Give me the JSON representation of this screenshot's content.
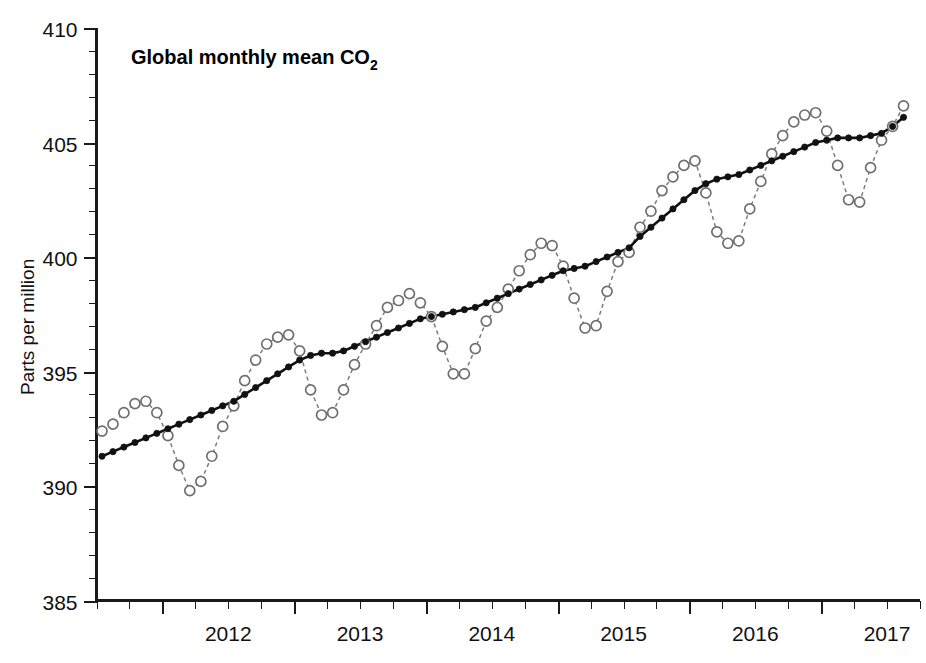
{
  "chart_data": {
    "type": "line",
    "title": "Global monthly mean CO2",
    "title_display": "Global monthly mean CO",
    "title_subscript": "2",
    "xlabel": "",
    "ylabel": "Parts per million",
    "ylim": [
      385,
      410
    ],
    "xlim": [
      2011.5,
      2017.75
    ],
    "grid": false,
    "legend": "none",
    "y_ticks_major": [
      385,
      390,
      395,
      400,
      405,
      410
    ],
    "y_ticks_major_labels": [
      "385",
      "390",
      "395",
      "400",
      "405",
      "410"
    ],
    "y_tick_minor_step": 1,
    "x_ticks_major": [
      2012,
      2013,
      2014,
      2015,
      2016,
      2017
    ],
    "x_ticks_major_labels": [
      "2012",
      "2013",
      "2014",
      "2015",
      "2016",
      "2017"
    ],
    "x_tick_minor_step": 0.25,
    "x_label_offset_years": 0.5,
    "series": [
      {
        "name": "Monthly mean",
        "style": "dashed-open-circles",
        "color": "#6f6f6f",
        "x": [
          2011.542,
          2011.625,
          2011.708,
          2011.792,
          2011.875,
          2011.958,
          2012.042,
          2012.125,
          2012.208,
          2012.292,
          2012.375,
          2012.458,
          2012.542,
          2012.625,
          2012.708,
          2012.792,
          2012.875,
          2012.958,
          2013.042,
          2013.125,
          2013.208,
          2013.292,
          2013.375,
          2013.458,
          2013.542,
          2013.625,
          2013.708,
          2013.792,
          2013.875,
          2013.958,
          2014.042,
          2014.125,
          2014.208,
          2014.292,
          2014.375,
          2014.458,
          2014.542,
          2014.625,
          2014.708,
          2014.792,
          2014.875,
          2014.958,
          2015.042,
          2015.125,
          2015.208,
          2015.292,
          2015.375,
          2015.458,
          2015.542,
          2015.625,
          2015.708,
          2015.792,
          2015.875,
          2015.958,
          2016.042,
          2016.125,
          2016.208,
          2016.292,
          2016.375,
          2016.458,
          2016.542,
          2016.625,
          2016.708,
          2016.792,
          2016.875,
          2016.958,
          2017.042,
          2017.125,
          2017.208,
          2017.292,
          2017.375,
          2017.458,
          2017.542,
          2017.625
        ],
        "values": [
          392.4,
          392.7,
          393.2,
          393.6,
          393.7,
          393.2,
          392.2,
          390.9,
          389.8,
          390.2,
          391.3,
          392.6,
          393.5,
          394.6,
          395.5,
          396.2,
          396.5,
          396.6,
          395.9,
          394.2,
          393.1,
          393.2,
          394.2,
          395.3,
          396.2,
          397.0,
          397.8,
          398.1,
          398.4,
          398.0,
          397.4,
          396.1,
          394.9,
          394.9,
          396.0,
          397.2,
          397.8,
          398.6,
          399.4,
          400.1,
          400.6,
          400.5,
          399.6,
          398.2,
          396.9,
          397.0,
          398.5,
          399.8,
          400.2,
          401.3,
          402.0,
          402.9,
          403.5,
          404.0,
          404.2,
          402.8,
          401.1,
          400.6,
          400.7,
          402.1,
          403.3,
          404.5,
          405.3,
          405.9,
          406.2,
          406.3,
          405.5,
          404.0,
          402.5,
          402.4,
          403.9,
          405.1,
          405.7,
          406.6
        ]
      },
      {
        "name": "Trend (seasonally adjusted)",
        "style": "solid-filled-circles",
        "color": "#111111",
        "x": [
          2011.542,
          2011.625,
          2011.708,
          2011.792,
          2011.875,
          2011.958,
          2012.042,
          2012.125,
          2012.208,
          2012.292,
          2012.375,
          2012.458,
          2012.542,
          2012.625,
          2012.708,
          2012.792,
          2012.875,
          2012.958,
          2013.042,
          2013.125,
          2013.208,
          2013.292,
          2013.375,
          2013.458,
          2013.542,
          2013.625,
          2013.708,
          2013.792,
          2013.875,
          2013.958,
          2014.042,
          2014.125,
          2014.208,
          2014.292,
          2014.375,
          2014.458,
          2014.542,
          2014.625,
          2014.708,
          2014.792,
          2014.875,
          2014.958,
          2015.042,
          2015.125,
          2015.208,
          2015.292,
          2015.375,
          2015.458,
          2015.542,
          2015.625,
          2015.708,
          2015.792,
          2015.875,
          2015.958,
          2016.042,
          2016.125,
          2016.208,
          2016.292,
          2016.375,
          2016.458,
          2016.542,
          2016.625,
          2016.708,
          2016.792,
          2016.875,
          2016.958,
          2017.042,
          2017.125,
          2017.208,
          2017.292,
          2017.375,
          2017.458,
          2017.542,
          2017.625
        ],
        "values": [
          391.3,
          391.5,
          391.7,
          391.9,
          392.1,
          392.3,
          392.5,
          392.7,
          392.9,
          393.1,
          393.3,
          393.5,
          393.7,
          394.0,
          394.3,
          394.6,
          394.9,
          395.2,
          395.5,
          395.7,
          395.8,
          395.8,
          395.9,
          396.1,
          396.3,
          396.5,
          396.7,
          396.9,
          397.1,
          397.3,
          397.4,
          397.5,
          397.6,
          397.7,
          397.8,
          398.0,
          398.2,
          398.4,
          398.6,
          398.8,
          399.0,
          399.2,
          399.4,
          399.5,
          399.6,
          399.8,
          400.0,
          400.2,
          400.4,
          400.9,
          401.3,
          401.7,
          402.1,
          402.5,
          402.9,
          403.2,
          403.4,
          403.5,
          403.6,
          403.8,
          404.0,
          404.2,
          404.4,
          404.6,
          404.8,
          405.0,
          405.1,
          405.2,
          405.2,
          405.2,
          405.3,
          405.4,
          405.7,
          406.1
        ]
      }
    ]
  },
  "axes": {
    "y_axis_title": "Parts per million",
    "y_tick_labels": [
      "410",
      "405",
      "400",
      "395",
      "390",
      "385"
    ],
    "x_tick_labels": [
      "2012",
      "2013",
      "2014",
      "2015",
      "2016",
      "2017"
    ]
  },
  "colors": {
    "axis": "#1a1a1a",
    "monthly": "#6f6f6f",
    "trend": "#111111",
    "background": "#ffffff"
  }
}
